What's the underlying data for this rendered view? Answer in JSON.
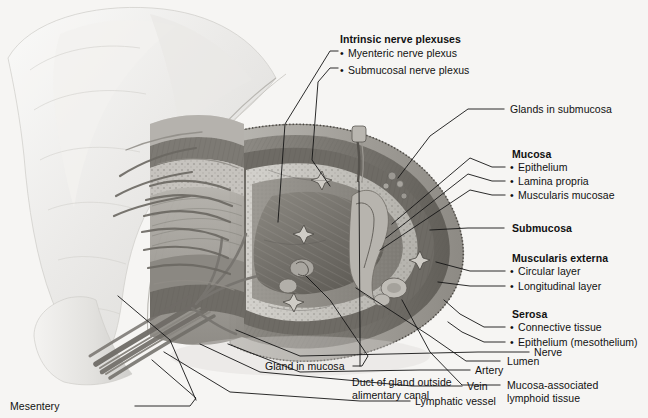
{
  "figure": {
    "background_color": "#f6f5f3",
    "line_color": "#1a1a1a",
    "watermark": ""
  },
  "groups": {
    "intrinsic": {
      "header": "Intrinsic nerve plexuses",
      "items": [
        "Myenteric nerve plexus",
        "Submucosal nerve plexus"
      ]
    },
    "mucosa": {
      "header": "Mucosa",
      "items": [
        "Epithelium",
        "Lamina propria",
        "Muscularis mucosae"
      ]
    },
    "submucosa": {
      "header": "Submucosa",
      "items": []
    },
    "muscularis_externa": {
      "header": "Muscularis externa",
      "items": [
        "Circular layer",
        "Longitudinal layer"
      ]
    },
    "serosa": {
      "header": "Serosa",
      "items": [
        "Connective tissue",
        "Epithelium (mesothelium)"
      ]
    }
  },
  "labels": {
    "glands_in_submucosa": "Glands in submucosa",
    "lumen": "Lumen",
    "malt_line1": "Mucosa-associated",
    "malt_line2": "lymphoid tissue",
    "gland_in_mucosa": "Gland in mucosa",
    "duct_line1": "Duct of gland outside",
    "duct_line2": "alimentary canal",
    "nerve": "Nerve",
    "artery": "Artery",
    "vein": "Vein",
    "lymphatic_vessel": "Lymphatic vessel",
    "mesentery": "Mesentery"
  }
}
